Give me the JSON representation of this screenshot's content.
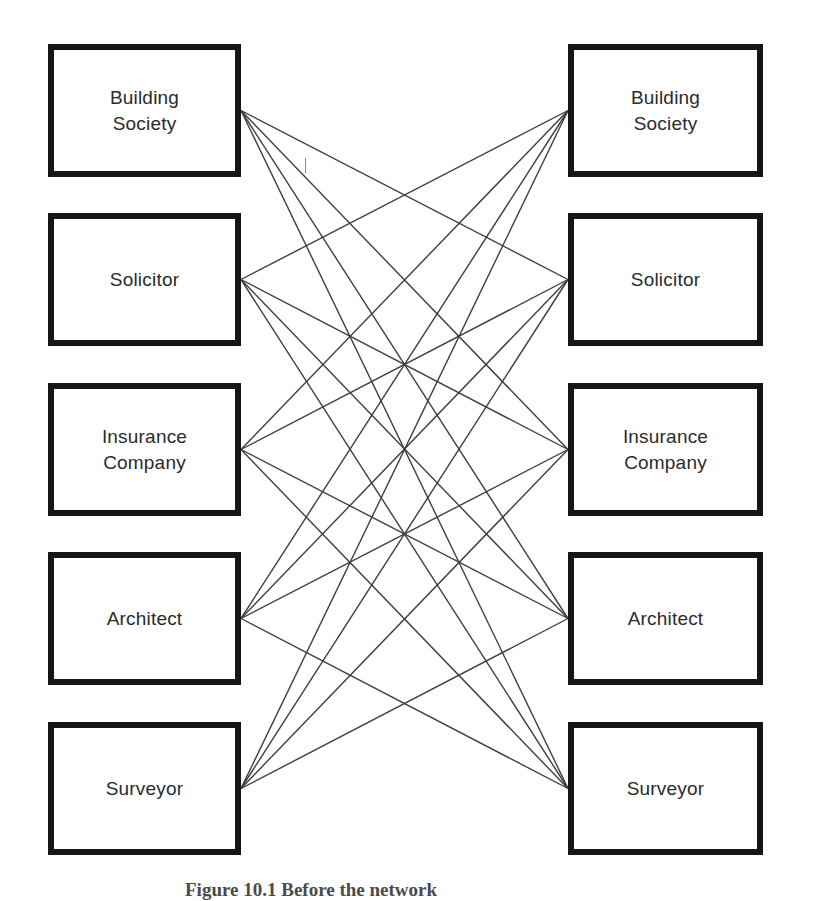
{
  "page": {
    "background": "#ffffff"
  },
  "diagram": {
    "left_column": {
      "items": [
        "Building Society",
        "Solicitor",
        "Insurance Company",
        "Architect",
        "Surveyor"
      ]
    },
    "right_column": {
      "items": [
        "Building Society",
        "Solicitor",
        "Insurance Company",
        "Architect",
        "Surveyor"
      ]
    },
    "connections": [
      [
        0,
        1
      ],
      [
        0,
        2
      ],
      [
        0,
        3
      ],
      [
        0,
        4
      ],
      [
        1,
        0
      ],
      [
        1,
        2
      ],
      [
        1,
        3
      ],
      [
        1,
        4
      ],
      [
        2,
        0
      ],
      [
        2,
        1
      ],
      [
        2,
        3
      ],
      [
        2,
        4
      ],
      [
        3,
        0
      ],
      [
        3,
        1
      ],
      [
        3,
        2
      ],
      [
        3,
        4
      ],
      [
        4,
        0
      ],
      [
        4,
        1
      ],
      [
        4,
        2
      ],
      [
        4,
        3
      ]
    ],
    "style": {
      "box_border_color": "#161616",
      "box_fill": "#ffffff",
      "line_color": "#3f3f3f",
      "label_color": "#2b2b2b"
    }
  },
  "caption": {
    "text": "Figure 10.1 Before the network"
  }
}
